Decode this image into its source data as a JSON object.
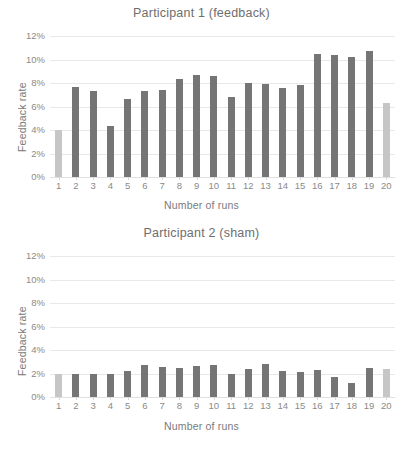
{
  "figure": {
    "width": 403,
    "height": 449,
    "background": "#ffffff"
  },
  "colors": {
    "bar_dark": "#757575",
    "bar_light": "#c6c6c6",
    "gridline": "#e8e8e8",
    "text": "#808080",
    "axis_text": "#8a8a8a"
  },
  "chart_data": [
    {
      "type": "bar",
      "title": "Participant 1 (feedback)",
      "xlabel": "Number  of runs",
      "ylabel": "Feedback rate",
      "categories": [
        "1",
        "2",
        "3",
        "4",
        "5",
        "6",
        "7",
        "8",
        "9",
        "10",
        "11",
        "12",
        "13",
        "14",
        "15",
        "16",
        "17",
        "18",
        "19",
        "20"
      ],
      "values": [
        4.0,
        7.7,
        7.3,
        4.3,
        6.6,
        7.3,
        7.4,
        8.3,
        8.7,
        8.6,
        6.8,
        8.0,
        7.9,
        7.6,
        7.8,
        10.5,
        10.4,
        10.2,
        10.7,
        6.3
      ],
      "bar_colors": [
        "light",
        "dark",
        "dark",
        "dark",
        "dark",
        "dark",
        "dark",
        "dark",
        "dark",
        "dark",
        "dark",
        "dark",
        "dark",
        "dark",
        "dark",
        "dark",
        "dark",
        "dark",
        "dark",
        "light"
      ],
      "yticks": [
        "0%",
        "2%",
        "4%",
        "6%",
        "8%",
        "10%",
        "12%"
      ],
      "ytick_values": [
        0,
        2,
        4,
        6,
        8,
        10,
        12
      ],
      "ylim": [
        0,
        12
      ],
      "value_unit": "%",
      "grid": true,
      "legend": "none"
    },
    {
      "type": "bar",
      "title": "Participant 2 (sham)",
      "xlabel": "Number  of runs",
      "ylabel": "Feedback rate",
      "categories": [
        "1",
        "2",
        "3",
        "4",
        "5",
        "6",
        "7",
        "8",
        "9",
        "10",
        "11",
        "12",
        "13",
        "14",
        "15",
        "16",
        "17",
        "18",
        "19",
        "20"
      ],
      "values": [
        1.95,
        1.95,
        2.0,
        1.95,
        2.2,
        2.75,
        2.55,
        2.5,
        2.65,
        2.7,
        1.95,
        2.4,
        2.8,
        2.25,
        2.1,
        2.3,
        1.7,
        1.2,
        2.5,
        2.4
      ],
      "bar_colors": [
        "light",
        "dark",
        "dark",
        "dark",
        "dark",
        "dark",
        "dark",
        "dark",
        "dark",
        "dark",
        "dark",
        "dark",
        "dark",
        "dark",
        "dark",
        "dark",
        "dark",
        "dark",
        "dark",
        "light"
      ],
      "yticks": [
        "0%",
        "2%",
        "4%",
        "6%",
        "8%",
        "10%",
        "12%"
      ],
      "ytick_values": [
        0,
        2,
        4,
        6,
        8,
        10,
        12
      ],
      "ylim": [
        0,
        12
      ],
      "value_unit": "%",
      "grid": true,
      "legend": "none"
    }
  ]
}
